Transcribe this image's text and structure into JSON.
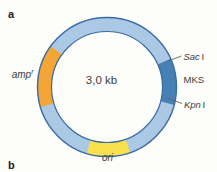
{
  "figure": {
    "type": "plasmid-map",
    "background_color": "#fdfdfa",
    "panel_a_label": "a",
    "panel_b_label": "b"
  },
  "plasmid": {
    "size_label": "3,0 kb",
    "ring_color": "#abc9e5",
    "outline_color": "#3a6ba5",
    "leader_line_color": "#5a646c",
    "text_color": "#3c3c3c",
    "segments": [
      {
        "name": "amp-resistance-gene",
        "label": "amp",
        "superscript": "r",
        "color": "#f3a636",
        "arc_start_deg": 253,
        "arc_end_deg": 306
      },
      {
        "name": "multiple-cloning-site",
        "label": "MKS",
        "color": "#4681b5",
        "arc_start_deg": 66,
        "arc_end_deg": 105
      },
      {
        "name": "origin-of-replication",
        "label": "ori",
        "color": "#f9e14d",
        "arc_start_deg": 160,
        "arc_end_deg": 197
      }
    ],
    "restriction_sites": [
      {
        "name": "sac1",
        "gene": "Sac",
        "numeral": "I"
      },
      {
        "name": "kpn1",
        "gene": "Kpn",
        "numeral": "I"
      }
    ]
  }
}
